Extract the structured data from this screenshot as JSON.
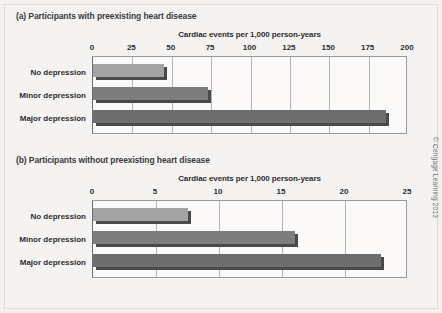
{
  "figure": {
    "credit": "© Cengage Learning 2013"
  },
  "panels": [
    {
      "id": "a",
      "title": "(a) Participants with preexisting heart disease",
      "axis_title": "Cardiac events per 1,000 person-years",
      "ticks": [
        "0",
        "25",
        "50",
        "75",
        "100",
        "125",
        "150",
        "175",
        "200"
      ],
      "categories": [
        "No depression",
        "Minor depression",
        "Major depression"
      ]
    },
    {
      "id": "b",
      "title": "(b) Participants without preexisting heart disease",
      "axis_title": "Cardiac events per 1,000 person-years",
      "ticks": [
        "0",
        "5",
        "10",
        "15",
        "20",
        "25"
      ],
      "categories": [
        "No depression",
        "Minor depression",
        "Major depression"
      ]
    }
  ],
  "chart_data": [
    {
      "type": "bar",
      "orientation": "horizontal",
      "title": "(a) Participants with preexisting heart disease",
      "xlabel": "Cardiac events per 1,000 person-years",
      "ylabel": "",
      "categories": [
        "No depression",
        "Minor depression",
        "Major depression"
      ],
      "values": [
        47,
        75,
        188
      ],
      "xlim": [
        0,
        200
      ],
      "xticks": [
        0,
        25,
        50,
        75,
        100,
        125,
        150,
        175,
        200
      ],
      "grid": true,
      "legend": "none",
      "colors": [
        "#a3a3a3",
        "#7d7d7d",
        "#6e6e6e"
      ]
    },
    {
      "type": "bar",
      "orientation": "horizontal",
      "title": "(b) Participants without preexisting heart disease",
      "xlabel": "Cardiac events per 1,000 person-years",
      "ylabel": "",
      "categories": [
        "No depression",
        "Minor depression",
        "Major depression"
      ],
      "values": [
        7.8,
        16.3,
        23.1
      ],
      "xlim": [
        0,
        25
      ],
      "xticks": [
        0,
        5,
        10,
        15,
        20,
        25
      ],
      "grid": true,
      "legend": "none",
      "colors": [
        "#a3a3a3",
        "#7d7d7d",
        "#6e6e6e"
      ]
    }
  ]
}
